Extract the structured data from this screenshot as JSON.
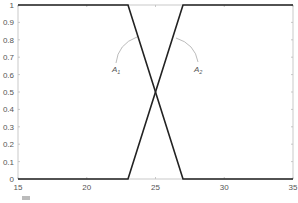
{
  "chart_data": {
    "type": "line",
    "title": "",
    "xlabel": "",
    "ylabel": "",
    "xlim": [
      15,
      35
    ],
    "ylim": [
      0,
      1
    ],
    "x_ticks": [
      "15",
      "20",
      "25",
      "30",
      "35"
    ],
    "y_ticks": [
      "0",
      "0.1",
      "0.2",
      "0.3",
      "0.4",
      "0.5",
      "0.6",
      "0.7",
      "0.8",
      "0.9",
      "1"
    ],
    "grid": false,
    "series": [
      {
        "name": "descending",
        "x": [
          15,
          23,
          27,
          35
        ],
        "y": [
          1,
          1,
          0,
          0
        ]
      },
      {
        "name": "ascending",
        "x": [
          15,
          23,
          27,
          35
        ],
        "y": [
          0,
          0,
          1,
          1
        ]
      }
    ],
    "annotations": [
      {
        "label": "A",
        "subscript": "1",
        "x": 23.3,
        "y": 0.62,
        "points_to": "descending slope"
      },
      {
        "label": "A",
        "subscript": "2",
        "x": 28.0,
        "y": 0.62,
        "points_to": "ascending slope"
      }
    ],
    "line_color": "#222222",
    "axis_color": "#bbbbbb"
  }
}
